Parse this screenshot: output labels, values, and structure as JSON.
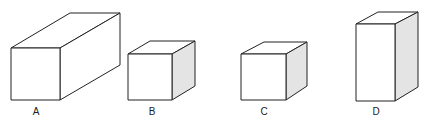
{
  "figure": {
    "boxes": [
      {
        "label": "A",
        "description": "long rectangular box, square front face, deep"
      },
      {
        "label": "B",
        "description": "cube with shaded right side"
      },
      {
        "label": "C",
        "description": "cube with shaded right side"
      },
      {
        "label": "D",
        "description": "tall rectangular box with shaded right side"
      }
    ],
    "colors": {
      "stroke": "#222222",
      "shade": "#e4e4e4",
      "face": "#ffffff"
    }
  }
}
